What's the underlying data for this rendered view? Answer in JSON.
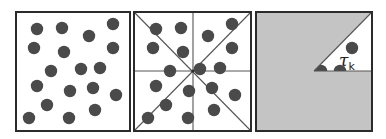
{
  "figure": {
    "colors": {
      "background": "#ffffff",
      "frame": "#2b2b2b",
      "dot": "#4a4a4a",
      "line": "#555555",
      "shade": "#c4c4c4",
      "label": "#222222"
    },
    "dot_radius": 6.2,
    "panels": [
      {
        "id": "points",
        "x": 16,
        "y": 12,
        "w": 114,
        "h": 119,
        "dots": [
          [
            37,
            29
          ],
          [
            62,
            28
          ],
          [
            89,
            36
          ],
          [
            113,
            24
          ],
          [
            34,
            48
          ],
          [
            64,
            52
          ],
          [
            113,
            48
          ],
          [
            51,
            71
          ],
          [
            81,
            69
          ],
          [
            100,
            68
          ],
          [
            37,
            86
          ],
          [
            70,
            91
          ],
          [
            93,
            88
          ],
          [
            116,
            95
          ],
          [
            47,
            105
          ],
          [
            95,
            110
          ],
          [
            29,
            118
          ],
          [
            69,
            118
          ]
        ]
      },
      {
        "id": "sectors",
        "x": 134,
        "y": 12,
        "w": 117,
        "h": 119,
        "center": [
          193,
          71
        ],
        "dots": [
          [
            156,
            29
          ],
          [
            181,
            28
          ],
          [
            208,
            36
          ],
          [
            232,
            24
          ],
          [
            153,
            48
          ],
          [
            183,
            52
          ],
          [
            232,
            48
          ],
          [
            170,
            71
          ],
          [
            200,
            69
          ],
          [
            220,
            68
          ],
          [
            156,
            86
          ],
          [
            189,
            91
          ],
          [
            212,
            88
          ],
          [
            235,
            95
          ],
          [
            166,
            105
          ],
          [
            214,
            110
          ],
          [
            148,
            118
          ],
          [
            188,
            118
          ]
        ]
      },
      {
        "id": "sector-highlight",
        "x": 256,
        "y": 12,
        "w": 116,
        "h": 119,
        "center": [
          314,
          71
        ],
        "wedge": [
          [
            314,
            71
          ],
          [
            372,
            12
          ],
          [
            372,
            71
          ]
        ],
        "dots": [
          [
            352,
            48
          ],
          [
            340,
            71
          ],
          [
            321,
            71
          ]
        ],
        "label": {
          "symbol": "τ",
          "subscript": "k",
          "x": 339,
          "y": 66
        }
      }
    ]
  }
}
